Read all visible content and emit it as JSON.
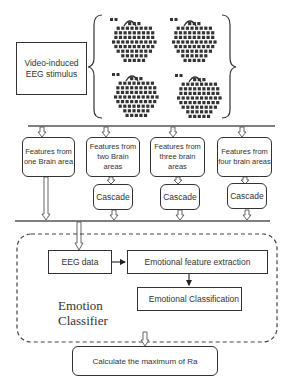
{
  "stimulus": {
    "label": "Video-induced EEG stimulus",
    "line1": "Video-induced",
    "line2": "EEG stimulus"
  },
  "brain_maps": [
    {
      "name": "brain-map-1"
    },
    {
      "name": "brain-map-2"
    },
    {
      "name": "brain-map-3"
    },
    {
      "name": "brain-map-4"
    }
  ],
  "features": [
    {
      "line1": "Features from",
      "line2": "one Brain area",
      "cascade": null
    },
    {
      "line1": "Features from",
      "line2": "two Brain areas",
      "cascade": "Cascade"
    },
    {
      "line1": "Features from",
      "line2": "three brain areas",
      "cascade": "Cascade"
    },
    {
      "line1": "Features from",
      "line2": "four brain areas",
      "cascade": "Cascade"
    }
  ],
  "classifier": {
    "title_line1": "Emotion",
    "title_line2": "Classifier",
    "eeg_data": "EEG data",
    "feature_extraction": "Emotional feature extraction",
    "classification": "Emotional Classification"
  },
  "result": {
    "label": "Calculate the maximum of Ra"
  }
}
